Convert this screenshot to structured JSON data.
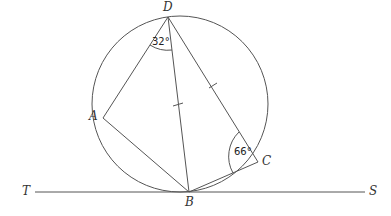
{
  "diagram": {
    "type": "circle-geometry",
    "points": {
      "D": {
        "label": "D",
        "x": 168,
        "y": 17
      },
      "A": {
        "label": "A",
        "x": 103,
        "y": 118
      },
      "B": {
        "label": "B",
        "x": 189,
        "y": 192
      },
      "C": {
        "label": "C",
        "x": 258,
        "y": 162
      },
      "T": {
        "label": "T",
        "x": 35,
        "y": 192
      },
      "S": {
        "label": "S",
        "x": 365,
        "y": 192
      }
    },
    "circle": {
      "cx": 180,
      "cy": 104,
      "r": 88
    },
    "tangent_line": {
      "from": "T",
      "to": "S",
      "through": "B"
    },
    "segments": [
      "DA",
      "AB",
      "DB",
      "DC",
      "BC"
    ],
    "equal_marks": [
      "DB",
      "DC"
    ],
    "angles": [
      {
        "vertex": "D",
        "between": [
          "A",
          "B"
        ],
        "value": "32°"
      },
      {
        "vertex": "C",
        "between": [
          "D",
          "B"
        ],
        "value": "66°"
      }
    ]
  }
}
